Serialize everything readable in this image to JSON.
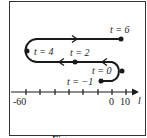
{
  "figure": {
    "axis": {
      "label": "l",
      "tick_labels": [
        "-60",
        "0",
        "10"
      ],
      "ticks": [
        -60,
        -50,
        -40,
        -30,
        -20,
        -10,
        0,
        10
      ]
    },
    "points": [
      {
        "t": "t = 6",
        "label": "t = 6"
      },
      {
        "t": "t = 4",
        "label": "t = 4"
      },
      {
        "t": "t = 2",
        "label": "t = 2"
      },
      {
        "t": "t = 0",
        "label": "t = 0"
      },
      {
        "t": "t = -1",
        "label": "t = −1"
      }
    ],
    "caption": "Figure"
  },
  "colors": {
    "ink": "#1a1a1a",
    "background": "#ffffff"
  }
}
